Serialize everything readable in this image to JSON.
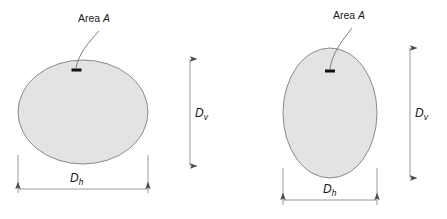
{
  "figure": {
    "background_color": "#ffffff",
    "shape_fill_color": "#e3e3e3",
    "shape_stroke_color": "#8a8a8a",
    "dimension_line_color": "#9a9a9a",
    "leader_line_color": "#6e6e6e",
    "tick_color": "#111111",
    "text_color": "#1a1a1a"
  },
  "panels": [
    {
      "id": "left-panel",
      "name": "oblate-ellipse-panel",
      "shape": {
        "name": "oblate-ellipse",
        "cx": 83,
        "cy": 112,
        "rx": 65,
        "ry": 52
      },
      "area_label": {
        "text": "Area",
        "symbol": "A",
        "x": 78,
        "y": 22
      },
      "tick_mark": {
        "x": 72,
        "y": 69,
        "width": 11,
        "height": 3
      },
      "vertical_dimension": {
        "label": "D",
        "subscript": "v",
        "x": 190,
        "y_top": 59,
        "y_bottom": 166,
        "label_x": 195,
        "label_y": 116
      },
      "horizontal_dimension": {
        "label": "D",
        "subscript": "h",
        "y": 189,
        "x_left": 18,
        "x_right": 148,
        "label_x": 70,
        "label_y": 182,
        "extension_top": 155
      }
    },
    {
      "id": "right-panel",
      "name": "prolate-ellipse-panel",
      "shape": {
        "name": "prolate-ellipse",
        "cx": 330,
        "cy": 113,
        "rx": 47,
        "ry": 65
      },
      "area_label": {
        "text": "Area",
        "symbol": "A",
        "x": 333,
        "y": 19
      },
      "tick_mark": {
        "x": 325,
        "y": 70,
        "width": 11,
        "height": 3
      },
      "vertical_dimension": {
        "label": "D",
        "subscript": "v",
        "x": 410,
        "y_top": 48,
        "y_bottom": 178,
        "label_x": 415,
        "label_y": 116
      },
      "horizontal_dimension": {
        "label": "D",
        "subscript": "h",
        "y": 200,
        "x_left": 283,
        "x_right": 377,
        "label_x": 323,
        "label_y": 193,
        "extension_top": 168
      }
    }
  ]
}
